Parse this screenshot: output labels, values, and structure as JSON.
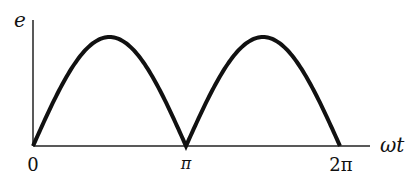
{
  "diagram": {
    "y_axis_label": "e",
    "x_axis_label": "ωt",
    "x_ticks": [
      "0",
      "π",
      "2π"
    ],
    "curve": "|sin(ωt)|",
    "colors": {
      "curve": "#111111",
      "axis": "#222222",
      "background": "#ffffff"
    }
  },
  "chart_data": {
    "type": "line",
    "title": "",
    "xlabel": "ωt",
    "ylabel": "e",
    "x_tick_labels": [
      "0",
      "π",
      "2π"
    ],
    "x": [
      0,
      0.5,
      1.0,
      1.5,
      2.0
    ],
    "x_unit": "π rad",
    "series": [
      {
        "name": "e = |sin ωt|",
        "values": [
          0,
          1,
          0,
          1,
          0
        ]
      }
    ],
    "xlim": [
      0,
      2.2
    ],
    "ylim": [
      0,
      1.1
    ],
    "grid": false,
    "legend": "none"
  }
}
